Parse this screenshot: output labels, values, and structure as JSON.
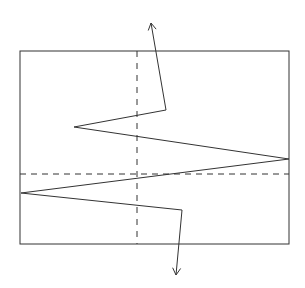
{
  "diagram": {
    "width": 305,
    "height": 288,
    "colors": {
      "stroke": "#333333",
      "background": "#ffffff"
    },
    "frame": {
      "x": 20,
      "y": 51,
      "width": 269,
      "height": 193
    },
    "vertical_dashed_line": {
      "x": 137,
      "y1": 51,
      "y2": 244
    },
    "horizontal_dashed_line": {
      "y": 174,
      "x1": 20,
      "x2": 289
    },
    "zigzag_path": [
      [
        151,
        23
      ],
      [
        166,
        110
      ],
      [
        74,
        127
      ],
      [
        289,
        159
      ],
      [
        21,
        193
      ],
      [
        182,
        210
      ],
      [
        176,
        275
      ]
    ],
    "arrows": [
      {
        "name": "top-arrow",
        "tip": [
          151,
          23
        ],
        "from": [
          166,
          110
        ]
      },
      {
        "name": "bottom-arrow",
        "tip": [
          176,
          275
        ],
        "from": [
          182,
          210
        ]
      }
    ]
  }
}
